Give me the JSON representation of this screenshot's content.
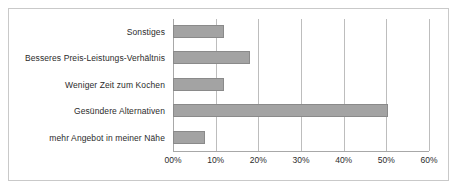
{
  "chart_data": {
    "type": "bar",
    "orientation": "horizontal",
    "title": "",
    "xlabel": "",
    "ylabel": "",
    "grid": true,
    "legend": "none",
    "xlim": [
      0,
      60
    ],
    "categories": [
      "Sonstiges",
      "Besseres Preis-Leistungs-Verhältnis",
      "Weniger Zeit zum Kochen",
      "Gesündere Alternativen",
      "mehr Angebot in meiner Nähe"
    ],
    "values": [
      12,
      18,
      12,
      50.5,
      7.5
    ],
    "value_unit": "%",
    "tick_values": [
      0,
      10,
      20,
      30,
      40,
      50,
      60
    ],
    "tick_labels": [
      "00%",
      "10%",
      "20%",
      "30%",
      "40%",
      "50%",
      "60%"
    ],
    "colors": {
      "bar_fill": "#a3a3a3",
      "bar_border": "#8a8a8a",
      "gridline": "#bdbdbd",
      "axis": "#a8a8a8",
      "frame": "#c9c9c9",
      "background": "#ffffff",
      "text": "#2b2b2b"
    }
  }
}
